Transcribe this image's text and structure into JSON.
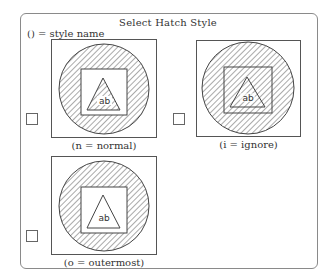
{
  "dialog": {
    "title": "Select Hatch Style",
    "legend": "() = style name"
  },
  "styles": [
    {
      "id": "normal",
      "caption": "(n = normal)",
      "icon": "hatch-normal-preview",
      "checked": false
    },
    {
      "id": "ignore",
      "caption": "(i = ignore)",
      "icon": "hatch-ignore-preview",
      "checked": false
    },
    {
      "id": "outermost",
      "caption": "(o = outermost)",
      "icon": "hatch-outermost-preview",
      "checked": false
    }
  ],
  "preview_text": "ab",
  "colors": {
    "stroke": "#444444",
    "hatch": "#555555",
    "border": "#8a8a8a"
  }
}
